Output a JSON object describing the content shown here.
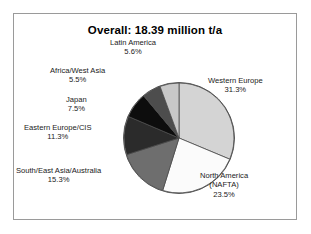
{
  "chart_data": {
    "type": "pie",
    "title": "Overall: 18.39 million t/a",
    "total_value": 18.39,
    "unit": "million t/a",
    "categories": [
      "Western Europe",
      "North America (NAFTA)",
      "South/East Asia/Australia",
      "Eastern Europe/CIS",
      "Japan",
      "Africa/West Asia",
      "Latin America"
    ],
    "values": [
      31.3,
      23.5,
      15.3,
      11.3,
      7.5,
      5.5,
      5.6
    ],
    "value_unit": "%",
    "legend": "none",
    "grid": false,
    "slices": [
      {
        "name": "Western Europe",
        "line2": "",
        "percent": "31.3%",
        "value": 31.3,
        "color": "#d4d4d4",
        "start_deg": 0.0,
        "end_deg": 112.68
      },
      {
        "name": "North America",
        "line2": "(NAFTA)",
        "percent": "23.5%",
        "value": 23.5,
        "color": "#fbfbfb",
        "start_deg": 112.68,
        "end_deg": 197.28
      },
      {
        "name": "South/East Asia/Australia",
        "line2": "",
        "percent": "15.3%",
        "value": 15.3,
        "color": "#6e6e6e",
        "start_deg": 197.28,
        "end_deg": 252.36
      },
      {
        "name": "Eastern Europe/CIS",
        "line2": "",
        "percent": "11.3%",
        "value": 11.3,
        "color": "#2b2b2b",
        "start_deg": 252.36,
        "end_deg": 293.04
      },
      {
        "name": "Japan",
        "line2": "",
        "percent": "7.5%",
        "value": 7.5,
        "color": "#0d0d0d",
        "start_deg": 293.04,
        "end_deg": 320.04
      },
      {
        "name": "Africa/West Asia",
        "line2": "",
        "percent": "5.5%",
        "value": 5.5,
        "color": "#4d4d4d",
        "start_deg": 320.04,
        "end_deg": 339.84
      },
      {
        "name": "Latin America",
        "line2": "",
        "percent": "5.6%",
        "value": 5.6,
        "color": "#c8c8c8",
        "start_deg": 339.84,
        "end_deg": 360.0
      }
    ]
  }
}
